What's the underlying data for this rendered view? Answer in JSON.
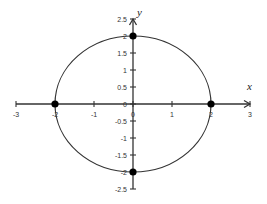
{
  "chart_data": {
    "type": "line",
    "title": "",
    "subtitle": "",
    "xlabel": "x",
    "ylabel": "y",
    "xlim": [
      -3,
      3
    ],
    "ylim": [
      -2.5,
      2.5
    ],
    "grid": false,
    "legend": null,
    "x_ticks": [
      -3,
      -2,
      -1,
      0,
      1,
      2,
      3
    ],
    "x_tick_labels": [
      "-3",
      "-2",
      "-1",
      "0",
      "1",
      "2",
      "3"
    ],
    "y_ticks": [
      2.5,
      2,
      1.5,
      1,
      0.5,
      0,
      -0.5,
      -1,
      -1.5,
      -2,
      -2.5
    ],
    "y_tick_labels": [
      "2.5",
      "2",
      "1.5",
      "1",
      "0.5",
      "0",
      "-0.5",
      "-1",
      "-1.5",
      "-2",
      "-2.5"
    ],
    "series": [
      {
        "name": "circle",
        "description": "Circle centered at origin with radius 2 (x^2 + y^2 = 4)",
        "center": [
          0,
          0
        ],
        "radius": 2,
        "color": "#333333"
      }
    ],
    "points": [
      {
        "x": -2,
        "y": 0
      },
      {
        "x": 2,
        "y": 0
      },
      {
        "x": 0,
        "y": 2
      },
      {
        "x": 0,
        "y": -2
      }
    ],
    "colors": {
      "axis": "#333333",
      "curve": "#333333",
      "points": "#000000",
      "background": "#ffffff"
    }
  }
}
